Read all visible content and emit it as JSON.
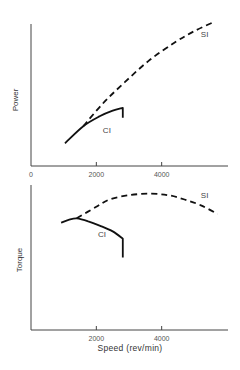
{
  "chart_data": [
    {
      "type": "line",
      "title": "",
      "xlabel": "",
      "ylabel": "Power",
      "xlim": [
        0,
        6000
      ],
      "ylim": [
        0,
        100
      ],
      "xticks": [
        0,
        2000,
        4000
      ],
      "xtick_labels": [
        "0",
        "2000",
        "4000"
      ],
      "yticks": [],
      "grid": false,
      "series": [
        {
          "name": "SI",
          "style": "dashed",
          "label": "SI",
          "label_at": {
            "x": 5200,
            "y": 91
          },
          "x": [
            1600,
            2200,
            2870,
            3600,
            4400,
            5000,
            5560
          ],
          "y": [
            28,
            44,
            59,
            74,
            87,
            95,
            101
          ]
        },
        {
          "name": "CI",
          "style": "solid",
          "label": "CI",
          "label_at": {
            "x": 2200,
            "y": 23
          },
          "x": [
            1040,
            1600,
            2100,
            2500,
            2810,
            2810
          ],
          "y": [
            16,
            28,
            35,
            39,
            41,
            34
          ]
        }
      ]
    },
    {
      "type": "line",
      "title": "",
      "xlabel": "Speed (rev/min)",
      "ylabel": "Torque",
      "xlim": [
        0,
        6000
      ],
      "ylim": [
        0,
        100
      ],
      "xticks": [
        2000,
        4000
      ],
      "xtick_labels": [
        "2000",
        "4000"
      ],
      "yticks": [],
      "grid": false,
      "series": [
        {
          "name": "SI",
          "style": "dashed",
          "label": "SI",
          "label_at": {
            "x": 5200,
            "y": 91
          },
          "x": [
            1400,
            2000,
            2410,
            3000,
            3630,
            4200,
            4700,
            5200,
            5710
          ],
          "y": [
            77,
            85,
            90,
            93,
            94,
            93,
            90,
            86,
            80
          ]
        },
        {
          "name": "CI",
          "style": "solid",
          "label": "CI",
          "label_at": {
            "x": 2050,
            "y": 64
          },
          "x": [
            920,
            1150,
            1400,
            1750,
            2100,
            2500,
            2810,
            2810
          ],
          "y": [
            74,
            76,
            77,
            75,
            72,
            68,
            63,
            50
          ]
        }
      ]
    }
  ]
}
